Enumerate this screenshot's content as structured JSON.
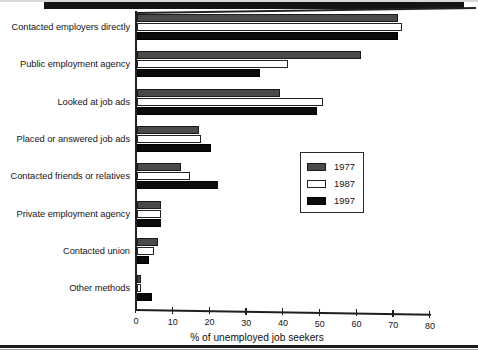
{
  "chart_data": {
    "type": "bar",
    "orientation": "horizontal",
    "title": "",
    "xlabel": "% of unemployed job seekers",
    "ylabel": "",
    "xlim": [
      0,
      80
    ],
    "xticks": [
      0,
      10,
      20,
      30,
      40,
      50,
      60,
      70,
      80
    ],
    "grid": false,
    "legend_position": "center-right",
    "categories": [
      "Contacted employers directly",
      "Public employment agency",
      "Looked at job ads",
      "Placed or answered job ads",
      "Contacted friends or relatives",
      "Private employment agency",
      "Contacted union",
      "Other methods"
    ],
    "series": [
      {
        "name": "1977",
        "fill": "stippled",
        "color": "#4a4a4a",
        "values": [
          71,
          61,
          39,
          17,
          12,
          6.5,
          5.7,
          1.2
        ]
      },
      {
        "name": "1987",
        "fill": "white",
        "color": "#ffffff",
        "values": [
          72,
          41,
          50.5,
          17.5,
          14.5,
          6.5,
          4.5,
          1.2
        ]
      },
      {
        "name": "1997",
        "fill": "solid",
        "color": "#0b0b0b",
        "values": [
          71,
          33.5,
          49,
          20,
          22,
          6.5,
          3.2,
          4
        ]
      }
    ]
  },
  "axis": {
    "x_title": "% of unemployed job seekers",
    "tick_labels": [
      "0",
      "10",
      "20",
      "30",
      "40",
      "50",
      "60",
      "70",
      "80"
    ]
  },
  "legend": {
    "entries": [
      {
        "label": "1977",
        "swatch": "stippled-swatch"
      },
      {
        "label": "1987",
        "swatch": "hollow-swatch"
      },
      {
        "label": "1997",
        "swatch": "solid-black-swatch"
      }
    ]
  },
  "colors": {
    "series_1977": "#4a4a4a",
    "series_1987": "#ffffff",
    "series_1997": "#0b0b0b",
    "axis": "#1f1f1f",
    "text": "#141414",
    "background": "#ffffff"
  }
}
